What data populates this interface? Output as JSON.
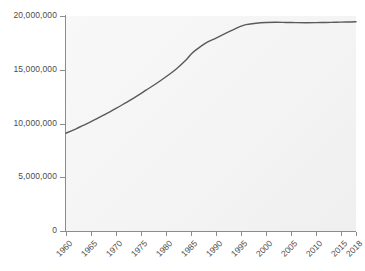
{
  "chart_data": {
    "type": "line",
    "title": "",
    "subtitle": "",
    "xlabel": "",
    "ylabel": "",
    "xlim": [
      1960,
      2018
    ],
    "ylim": [
      0,
      20000000
    ],
    "grid": false,
    "legend": null,
    "legend_position": "none",
    "line_color": "#5a5a5a",
    "plot_background": "#f6f6f6",
    "axis_color": "#8c8c8c",
    "tick_label_color": "#4d4d4d",
    "y_ticks": [
      {
        "value": 0,
        "label": "0"
      },
      {
        "value": 5000000,
        "label": "5,000,000"
      },
      {
        "value": 10000000,
        "label": "10,000,000"
      },
      {
        "value": 15000000,
        "label": "15,000,000"
      },
      {
        "value": 20000000,
        "label": "20,000,000"
      }
    ],
    "x_ticks": [
      {
        "value": 1960,
        "label": "1960"
      },
      {
        "value": 1965,
        "label": "1965"
      },
      {
        "value": 1970,
        "label": "1970"
      },
      {
        "value": 1975,
        "label": "1975"
      },
      {
        "value": 1980,
        "label": "1980"
      },
      {
        "value": 1985,
        "label": "1985"
      },
      {
        "value": 1990,
        "label": "1990"
      },
      {
        "value": 1995,
        "label": "1995"
      },
      {
        "value": 2000,
        "label": "2000"
      },
      {
        "value": 2005,
        "label": "2005"
      },
      {
        "value": 2010,
        "label": "2010"
      },
      {
        "value": 2015,
        "label": "2015"
      },
      {
        "value": 2018,
        "label": "2018"
      }
    ],
    "series": [
      {
        "name": "",
        "x": [
          1960,
          1962,
          1964,
          1966,
          1968,
          1970,
          1972,
          1974,
          1976,
          1978,
          1980,
          1982,
          1984,
          1985,
          1986,
          1988,
          1990,
          1992,
          1994,
          1995,
          1996,
          1998,
          2000,
          2002,
          2004,
          2006,
          2008,
          2010,
          2012,
          2014,
          2016,
          2018
        ],
        "values": [
          9100000,
          9500000,
          9950000,
          10400000,
          10900000,
          11400000,
          11950000,
          12500000,
          13100000,
          13700000,
          14350000,
          15050000,
          15900000,
          16450000,
          16850000,
          17500000,
          17950000,
          18400000,
          18850000,
          19050000,
          19200000,
          19330000,
          19400000,
          19420000,
          19400000,
          19380000,
          19370000,
          19380000,
          19400000,
          19420000,
          19440000,
          19460000
        ]
      }
    ]
  }
}
